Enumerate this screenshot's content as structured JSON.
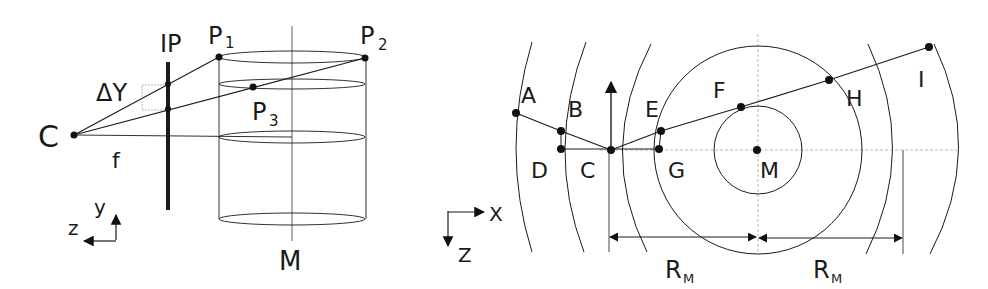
{
  "left_figure": {
    "labels": {
      "image_plane": "IP",
      "camera": "C",
      "focal": "f",
      "delta_y": "ΔY",
      "p1": "P",
      "p1_sub": "1",
      "p2": "P",
      "p2_sub": "2",
      "p3": "P",
      "p3_sub": "3",
      "axis_m": "M",
      "axis_y": "y",
      "axis_z": "z"
    }
  },
  "right_figure": {
    "labels": {
      "a": "A",
      "b": "B",
      "c": "C",
      "d": "D",
      "e": "E",
      "f": "F",
      "g": "G",
      "h": "H",
      "i": "I",
      "m": "M",
      "axis_x": "X",
      "axis_z": "Z",
      "radius_1": "R",
      "radius_1_sub": "M",
      "radius_2": "R",
      "radius_2_sub": "M"
    }
  },
  "colors": {
    "ink": "#1a1a1a",
    "guide": "#888888",
    "background": "#ffffff"
  }
}
